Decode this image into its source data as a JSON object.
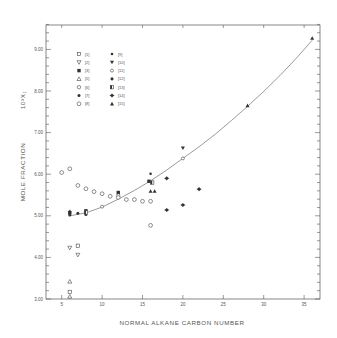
{
  "chart_data": {
    "type": "scatter",
    "title": "",
    "xlabel": "NORMAL ALKANE CARBON NUMBER",
    "ylabel": "MOLE FRACTION",
    "ylabel_unit": "10³X₁",
    "xlim": [
      3.5,
      37
    ],
    "ylim": [
      3.0,
      9.6
    ],
    "x_ticks": [
      5,
      10,
      15,
      20,
      25,
      30,
      35
    ],
    "x_tick_labels": [
      "5",
      "10",
      "15",
      "20",
      "25",
      "30",
      "35"
    ],
    "y_ticks": [
      3,
      4,
      5,
      6,
      7,
      8,
      9
    ],
    "y_tick_labels": [
      "3.00",
      "4.00",
      "5.00",
      "6.00",
      "7.00",
      "8.00",
      "9.00"
    ],
    "grid": false,
    "legend_position": "upper-left",
    "series": [
      {
        "name": "[1]",
        "marker": "square-open",
        "points": [
          [
            6,
            3.17
          ],
          [
            7,
            4.28
          ]
        ]
      },
      {
        "name": "[2]",
        "marker": "triangle-down-open",
        "points": [
          [
            6,
            4.23
          ],
          [
            7,
            4.06
          ]
        ]
      },
      {
        "name": "[3]",
        "marker": "square-filled",
        "points": [
          [
            6,
            5.07
          ],
          [
            8,
            5.12
          ],
          [
            12,
            5.56
          ],
          [
            15.8,
            5.83
          ]
        ]
      },
      {
        "name": "[5]",
        "marker": "triangle-open",
        "points": [
          [
            6,
            3.42
          ],
          [
            6,
            3.06
          ]
        ]
      },
      {
        "name": "[6]",
        "marker": "hexagon-open",
        "points": [
          [
            12,
            5.49
          ]
        ]
      },
      {
        "name": "[7]",
        "marker": "circle-filled",
        "points": [
          [
            6,
            5.02
          ],
          [
            7,
            5.06
          ],
          [
            8,
            5.03
          ]
        ]
      },
      {
        "name": "[8]",
        "marker": "circle-open-large",
        "points": [
          [
            5,
            6.04
          ],
          [
            6,
            6.13
          ],
          [
            7,
            5.73
          ],
          [
            8,
            5.65
          ],
          [
            9,
            5.58
          ],
          [
            10,
            5.53
          ],
          [
            11,
            5.47
          ],
          [
            12,
            5.44
          ],
          [
            13,
            5.39
          ],
          [
            14,
            5.39
          ],
          [
            15,
            5.35
          ],
          [
            16,
            5.35
          ],
          [
            16,
            4.77
          ]
        ]
      },
      {
        "name": "[9]",
        "marker": "circle-filled-small",
        "points": [
          [
            16,
            6.01
          ]
        ]
      },
      {
        "name": "[10]",
        "marker": "triangle-down-filled",
        "points": [
          [
            20,
            6.63
          ]
        ]
      },
      {
        "name": "[11]",
        "marker": "circle-open-small",
        "points": [
          [
            10,
            5.22
          ],
          [
            20,
            6.38
          ]
        ]
      },
      {
        "name": "[12]",
        "marker": "starburst",
        "points": [
          [
            6,
            5.1
          ]
        ]
      },
      {
        "name": "[13]",
        "marker": "square-half",
        "points": [
          [
            8,
            5.08
          ],
          [
            16.2,
            5.8
          ]
        ]
      },
      {
        "name": "[14]",
        "marker": "diamond-filled",
        "points": [
          [
            18,
            5.9
          ],
          [
            18,
            5.14
          ],
          [
            20,
            5.26
          ],
          [
            22,
            5.64
          ]
        ]
      },
      {
        "name": "[15]",
        "marker": "triangle-filled",
        "points": [
          [
            16,
            5.59
          ],
          [
            16.5,
            5.59
          ],
          [
            28,
            7.65
          ],
          [
            36,
            9.27
          ]
        ]
      }
    ],
    "fit_curve": {
      "description": "smooth fitted curve through data",
      "points": [
        [
          6,
          5.0
        ],
        [
          8,
          5.07
        ],
        [
          10,
          5.21
        ],
        [
          12,
          5.4
        ],
        [
          14,
          5.61
        ],
        [
          16,
          5.84
        ],
        [
          18,
          6.1
        ],
        [
          20,
          6.38
        ],
        [
          22,
          6.66
        ],
        [
          24,
          6.96
        ],
        [
          26,
          7.29
        ],
        [
          28,
          7.63
        ],
        [
          30,
          7.99
        ],
        [
          32,
          8.37
        ],
        [
          34,
          8.78
        ],
        [
          36,
          9.22
        ]
      ]
    }
  },
  "legend": {
    "col1": [
      "[1]",
      "[2]",
      "[3]",
      "[5]",
      "[6]",
      "[7]",
      "[8]"
    ],
    "col2": [
      "[9]",
      "[10]",
      "[11]",
      "[12]",
      "[13]",
      "[14]",
      "[15]"
    ]
  }
}
